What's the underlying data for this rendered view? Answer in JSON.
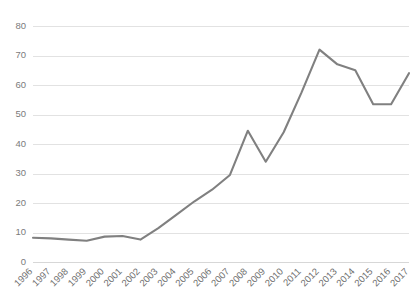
{
  "chart_data": {
    "type": "line",
    "title": "",
    "subtitle": "",
    "xlabel": "",
    "ylabel": "",
    "categories": [
      "1996",
      "1997",
      "1998",
      "1999",
      "2000",
      "2001",
      "2002",
      "2003",
      "2004",
      "2005",
      "2006",
      "2007",
      "2008",
      "2009",
      "2010",
      "2011",
      "2012",
      "2013",
      "2014",
      "2015",
      "2016",
      "2017"
    ],
    "values": [
      8.2,
      8.0,
      7.6,
      7.2,
      8.6,
      8.8,
      7.6,
      11.5,
      16.0,
      20.5,
      24.5,
      29.5,
      44.5,
      34.0,
      44.0,
      57.5,
      72.0,
      67.0,
      65.0,
      53.5,
      53.5,
      64.0
    ],
    "series": [
      {
        "name": "series-1",
        "color": "#808080",
        "values": [
          8.2,
          8.0,
          7.6,
          7.2,
          8.6,
          8.8,
          7.6,
          11.5,
          16.0,
          20.5,
          24.5,
          29.5,
          44.5,
          34.0,
          44.0,
          57.5,
          72.0,
          67.0,
          65.0,
          53.5,
          53.5,
          64.0
        ]
      }
    ],
    "ylim": [
      0,
      80
    ],
    "yticks": [
      0,
      10,
      20,
      30,
      40,
      50,
      60,
      70,
      80
    ],
    "ytick_labels": [
      "0",
      "10",
      "20",
      "30",
      "40",
      "50",
      "60",
      "70",
      "80"
    ],
    "grid": true,
    "grid_axis": "y",
    "legend": false,
    "legend_position": "none",
    "x_tick_rotation": -45,
    "annotations": []
  },
  "style": {
    "background": "#ffffff",
    "gridline_color": "#e2e2e2",
    "axis_text_color": "#7b7b7b",
    "line_color": "#808080"
  }
}
